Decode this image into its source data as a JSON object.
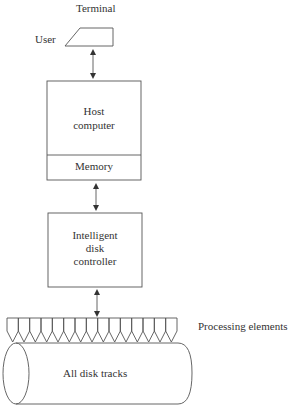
{
  "diagram": {
    "terminal": {
      "label": "Terminal",
      "user_label": "User"
    },
    "host": {
      "line1": "Host",
      "line2": "computer",
      "memory": "Memory"
    },
    "controller": {
      "line1": "Intelligent",
      "line2": "disk",
      "line3": "controller"
    },
    "processing_elements": {
      "label": "Processing elements",
      "count": 15
    },
    "disk": {
      "label": "All disk tracks"
    },
    "colors": {
      "line": "#555555",
      "text": "#333333",
      "background": "#ffffff"
    }
  }
}
